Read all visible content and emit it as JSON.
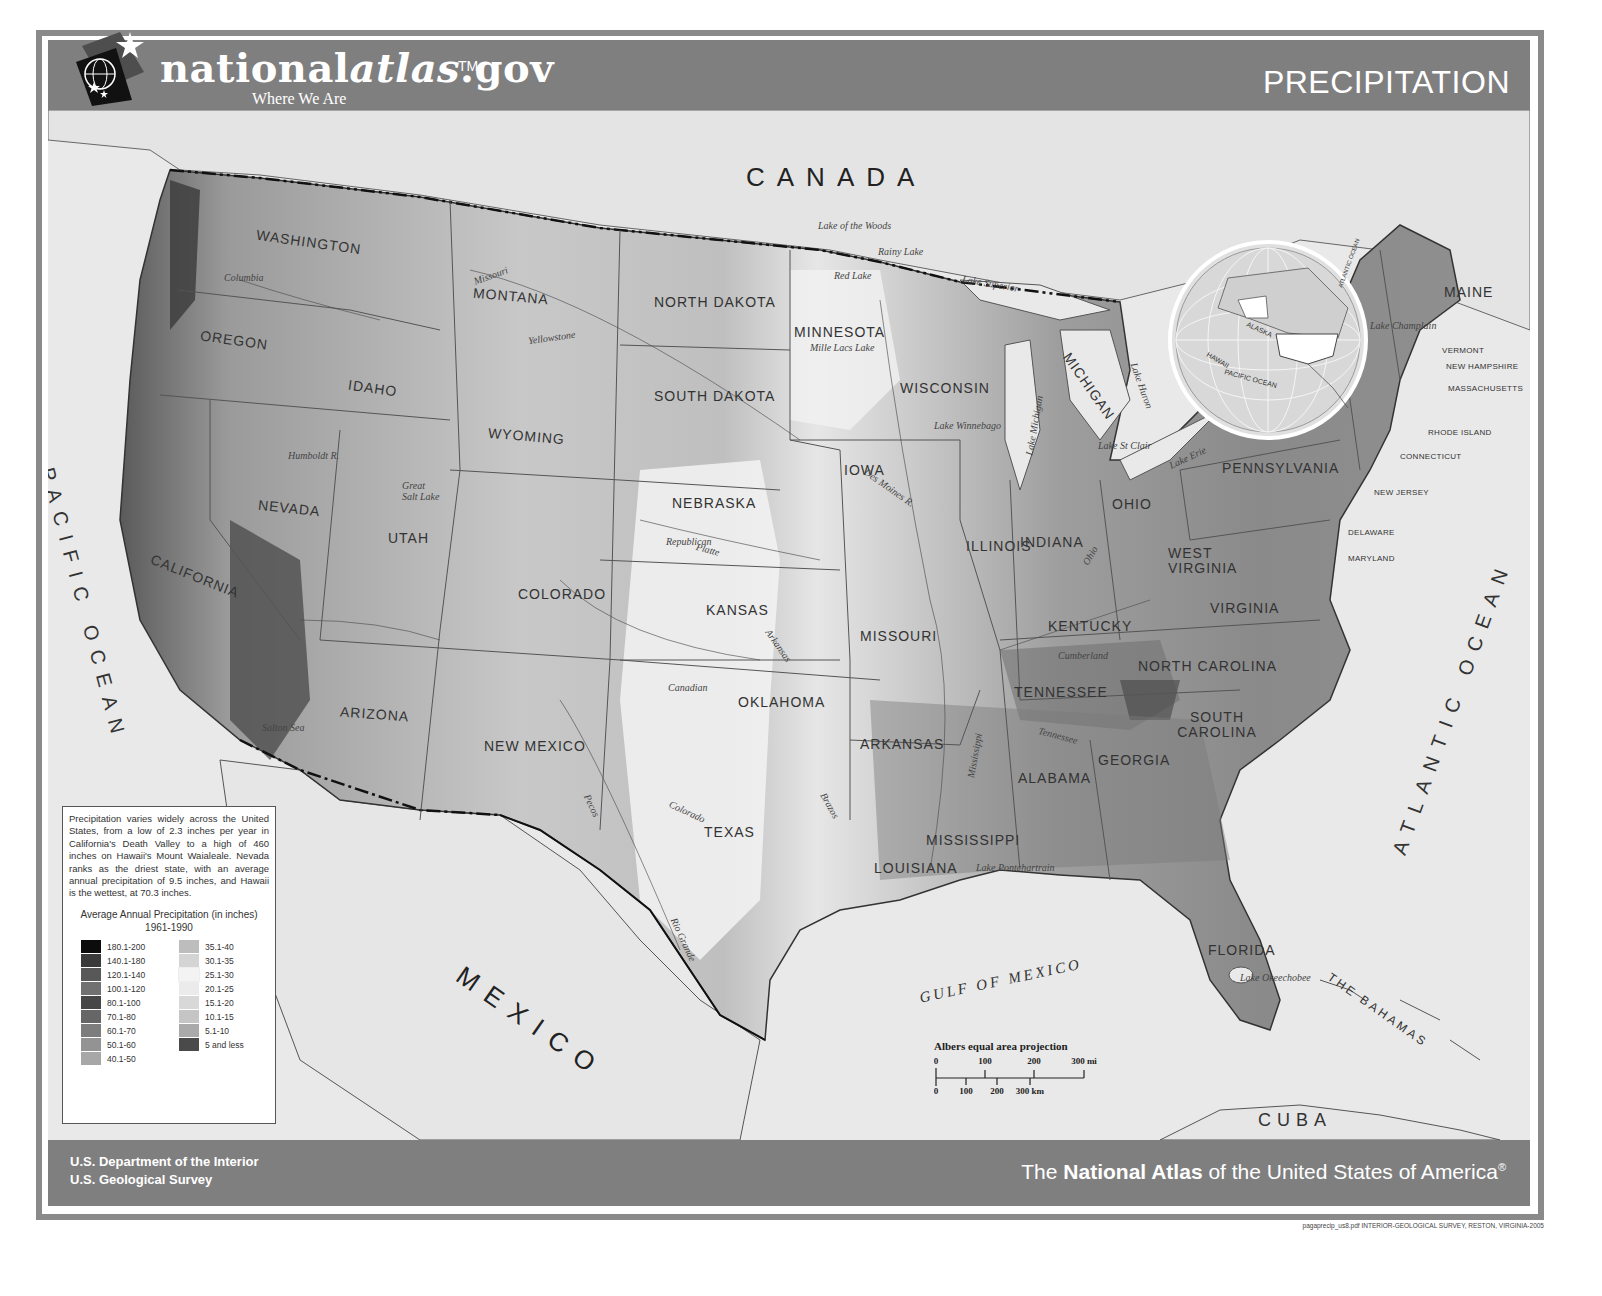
{
  "header": {
    "logo_name_plain": "national",
    "logo_name_italic": "atlas",
    "logo_name_suffix": ".gov",
    "logo_tm": "TM",
    "logo_tagline": "Where We Are",
    "title": "PRECIPITATION"
  },
  "map": {
    "countries": {
      "canada": "CANADA",
      "mexico": "MEXICO",
      "cuba": "CUBA",
      "bahamas": "THE BAHAMAS"
    },
    "oceans": {
      "pacific": "PACIFIC OCEAN",
      "atlantic": "ATLANTIC OCEAN",
      "gulf": "GULF OF MEXICO"
    },
    "states": {
      "washington": "WASHINGTON",
      "oregon": "OREGON",
      "california": "CALIFORNIA",
      "nevada": "NEVADA",
      "idaho": "IDAHO",
      "montana": "MONTANA",
      "wyoming": "WYOMING",
      "utah": "UTAH",
      "arizona": "ARIZONA",
      "colorado": "COLORADO",
      "new_mexico": "NEW MEXICO",
      "north_dakota": "NORTH DAKOTA",
      "south_dakota": "SOUTH DAKOTA",
      "nebraska": "NEBRASKA",
      "kansas": "KANSAS",
      "oklahoma": "OKLAHOMA",
      "texas": "TEXAS",
      "minnesota": "MINNESOTA",
      "iowa": "IOWA",
      "missouri": "MISSOURI",
      "arkansas": "ARKANSAS",
      "louisiana": "LOUISIANA",
      "wisconsin": "WISCONSIN",
      "illinois": "ILLINOIS",
      "michigan": "MICHIGAN",
      "indiana": "INDIANA",
      "ohio": "OHIO",
      "kentucky": "KENTUCKY",
      "tennessee": "TENNESSEE",
      "mississippi": "MISSISSIPPI",
      "alabama": "ALABAMA",
      "georgia": "GEORGIA",
      "florida": "FLORIDA",
      "south_carolina": "SOUTH CAROLINA",
      "north_carolina": "NORTH CAROLINA",
      "virginia": "VIRGINIA",
      "west_virginia": "WEST VIRGINIA",
      "pennsylvania": "PENNSYLVANIA",
      "new_york": "NEW YORK",
      "maine": "MAINE",
      "vermont": "VERMONT",
      "new_hampshire": "NEW HAMPSHIRE",
      "massachusetts": "MASSACHUSETTS",
      "rhode_island": "RHODE ISLAND",
      "connecticut": "CONNECTICUT",
      "new_jersey": "NEW JERSEY",
      "delaware": "DELAWARE",
      "maryland": "MARYLAND"
    },
    "water_labels": {
      "lake_of_the_woods": "Lake of the Woods",
      "rainy_lake": "Rainy Lake",
      "red_lake": "Red Lake",
      "mille_lacs": "Mille Lacs Lake",
      "lake_superior": "Lake Superior",
      "lake_michigan": "Lake Michigan",
      "lake_huron": "Lake Huron",
      "lake_erie": "Lake Erie",
      "lake_ontario": "Lake Ontario",
      "lake_st_clair": "Lake St Clair",
      "lake_winnebago": "Lake Winnebago",
      "great_salt_lake": "Great Salt Lake",
      "lake_pontchartrain": "Lake Pontchartrain",
      "lake_okeechobee": "Lake Okeechobee",
      "lake_champlain": "Lake Champlain",
      "salton_sea": "Salton Sea",
      "missouri": "Missouri",
      "yellowstone": "Yellowstone",
      "columbia": "Columbia",
      "snake": "Snake",
      "platte": "Platte",
      "republican": "Republican",
      "arkansas": "Arkansas",
      "canadian": "Canadian",
      "red": "Red",
      "colorado": "Colorado",
      "brazos": "Brazos",
      "pecos": "Pecos",
      "rio_grande": "Rio Grande",
      "mississippi": "Mississippi",
      "ohio": "Ohio",
      "tennessee": "Tennessee",
      "cumberland": "Cumberland",
      "humboldt": "Humboldt R.",
      "green": "Green",
      "des_moines": "Des Moines R.",
      "kansas_r": "Kansas"
    },
    "inset": {
      "alaska": "ALASKA",
      "hawaii": "HAWAII",
      "pacific": "PACIFIC OCEAN",
      "atlantic": "ATLANTIC OCEAN"
    }
  },
  "legend": {
    "description": "Precipitation varies widely across the United States, from a low of 2.3 inches per year in California's Death Valley to a high of 460 inches on Hawaii's Mount Waialeale. Nevada ranks as the driest state, with an average annual precipitation of 9.5 inches, and Hawaii is the wettest, at 70.3 inches.",
    "title": "Average Annual Precipitation (in inches)",
    "period": "1961-1990",
    "left_column": [
      {
        "label": "180.1-200",
        "color": "#0c0c0c"
      },
      {
        "label": "140.1-180",
        "color": "#3a3a3a"
      },
      {
        "label": "120.1-140",
        "color": "#585858"
      },
      {
        "label": "100.1-120",
        "color": "#717171"
      },
      {
        "label": "80.1-100",
        "color": "#474747"
      },
      {
        "label": "70.1-80",
        "color": "#666666"
      },
      {
        "label": "60.1-70",
        "color": "#7d7d7d"
      },
      {
        "label": "50.1-60",
        "color": "#939393"
      },
      {
        "label": "40.1-50",
        "color": "#a7a7a7"
      }
    ],
    "right_column": [
      {
        "label": "35.1-40",
        "color": "#bdbdbd"
      },
      {
        "label": "30.1-35",
        "color": "#d4d4d4"
      },
      {
        "label": "25.1-30",
        "color": "#f3f3f3"
      },
      {
        "label": "20.1-25",
        "color": "#ebebeb"
      },
      {
        "label": "15.1-20",
        "color": "#d8d8d8"
      },
      {
        "label": "10.1-15",
        "color": "#c5c5c5"
      },
      {
        "label": "5.1-10",
        "color": "#aaaaaa"
      },
      {
        "label": "5 and less",
        "color": "#4a4a4a"
      }
    ]
  },
  "scale_bar": {
    "title": "Albers equal area projection",
    "miles_ticks": [
      "0",
      "100",
      "200",
      "300 mi"
    ],
    "km_ticks": [
      "0",
      "100",
      "200",
      "300 km"
    ]
  },
  "footer": {
    "agency_line1": "U.S. Department of the Interior",
    "agency_line2": "U.S. Geological Survey",
    "atlas_prefix": "The ",
    "atlas_bold": "National Atlas",
    "atlas_suffix": " of the United States of America",
    "atlas_mark": "®",
    "fineprint": "pagaprecip_us8.pdf INTERIOR-GEOLOGICAL SURVEY, RESTON, VIRGINIA-2005"
  },
  "colors": {
    "band": "#7f7f7f",
    "map_background": "#e9e9e9",
    "land_wet": "#7a7a7a",
    "land_dry": "#f0f0f0"
  }
}
